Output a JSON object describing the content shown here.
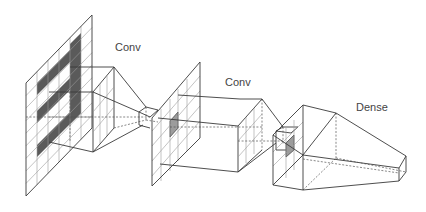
{
  "diagram": {
    "title": "",
    "type": "convolutional-neural-network-architecture",
    "labels": {
      "conv1": "Conv",
      "conv2": "Conv",
      "dense": "Dense"
    },
    "layers": [
      {
        "name": "input",
        "kind": "grid-plane",
        "description": "input image grid with digit-like shaded pattern"
      },
      {
        "name": "conv1",
        "kind": "frustum",
        "label": "Conv"
      },
      {
        "name": "feature-map-1",
        "kind": "grid-plane",
        "highlighted_cell": true
      },
      {
        "name": "conv2",
        "kind": "frustum",
        "label": "Conv"
      },
      {
        "name": "feature-map-2",
        "kind": "grid-plane",
        "highlighted_cell": true
      },
      {
        "name": "dense",
        "kind": "frustum",
        "label": "Dense"
      }
    ],
    "colors": {
      "line": "#3a3a3a",
      "grid": "#9a9a9a",
      "shade_dark": "#5a5a5a",
      "shade_highlight": "#9c9c9c",
      "background": "#ffffff"
    }
  }
}
